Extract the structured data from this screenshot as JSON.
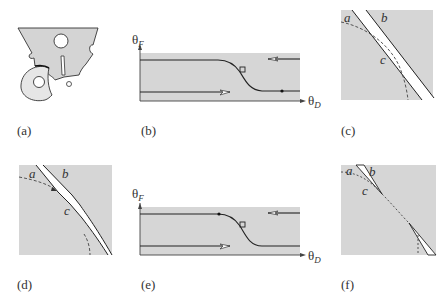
{
  "figure": {
    "panels": [
      {
        "id": "a",
        "label": "(a)",
        "kind": "gear-and-cam-sketch"
      },
      {
        "id": "b",
        "label": "(b)",
        "kind": "phase-plot",
        "y_axis": "θ",
        "y_sub": "F",
        "x_axis": "θ",
        "x_sub": "D"
      },
      {
        "id": "c",
        "label": "(c)",
        "kind": "boundary-closeup",
        "curve_labels": {
          "a": "a",
          "b": "b",
          "c": "c"
        }
      },
      {
        "id": "d",
        "label": "(d)",
        "kind": "boundary-closeup",
        "curve_labels": {
          "a": "a",
          "b": "b",
          "c": "c"
        }
      },
      {
        "id": "e",
        "label": "(e)",
        "kind": "phase-plot",
        "y_axis": "θ",
        "y_sub": "F",
        "x_axis": "θ",
        "x_sub": "D"
      },
      {
        "id": "f",
        "label": "(f)",
        "kind": "boundary-closeup",
        "curve_labels": {
          "a": "a",
          "b": "b",
          "c": "c"
        }
      }
    ]
  },
  "colors": {
    "fill_gray": "#d4d4d4",
    "light_fill": "#e6e6e6",
    "line": "#222222",
    "background": "#ffffff"
  }
}
